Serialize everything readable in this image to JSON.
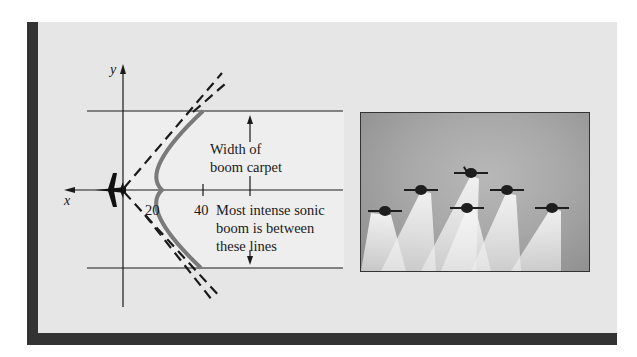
{
  "diagram": {
    "axes": {
      "x_label": "x",
      "y_label": "y"
    },
    "ticks": [
      {
        "label": "20"
      },
      {
        "label": "40"
      }
    ],
    "annotations": {
      "width_label_line1": "Width of",
      "width_label_line2": "boom carpet",
      "intense_label_line1": "Most intense sonic",
      "intense_label_line2": "boom is between",
      "intense_label_line3": "these lines"
    },
    "colors": {
      "curve": "#7a7a7a",
      "frame": "#333333",
      "panel": "#e6e6e6"
    }
  },
  "photo": {
    "description": "Six jets flying in formation with smoke trails",
    "jet_count": 6
  }
}
